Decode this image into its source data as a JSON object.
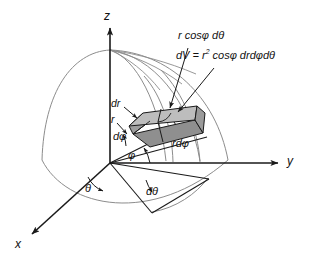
{
  "figure": {
    "background_color": "#ffffff",
    "line_color": "#1a1a1a",
    "sphere_arc_color": "#8c8c8c",
    "wedge_top_color": "#b5b5b5",
    "wedge_side_color": "#8f8f8f",
    "wedge_front_color": "#a6a6a6"
  },
  "axes": [
    {
      "name": "z-axis",
      "label": "z",
      "direction": "up"
    },
    {
      "name": "y-axis",
      "label": "y",
      "direction": "right"
    },
    {
      "name": "x-axis",
      "label": "x",
      "direction": "down-left"
    }
  ],
  "labels": {
    "z_axis": "z",
    "y_axis": "y",
    "x_axis": "x",
    "arc_length_theta": "r cosφ dθ",
    "volume_prefix": "dV = ",
    "volume_base": "r",
    "volume_exponent": "2",
    "volume_suffix": " cosφ drdφdθ",
    "dr": "dr",
    "r": "r",
    "d_phi": "dφ",
    "phi": "φ",
    "theta": "θ",
    "d_theta": "dθ",
    "r_d_phi": "rdφ"
  },
  "annotations": [
    {
      "name": "arc-length-theta-callout",
      "text": "r cosφ dθ",
      "points_to": "volume-element-top-edge"
    },
    {
      "name": "volume-formula-callout",
      "text": "dV = r² cosφ drdφdθ",
      "points_to": "volume-element"
    },
    {
      "name": "dr-callout",
      "text": "dr",
      "points_to": "volume-element-radial-edge"
    },
    {
      "name": "r-callout",
      "text": "r",
      "points_to": "radial-ray"
    },
    {
      "name": "d-phi-angle",
      "text": "dφ",
      "points_to": "phi-increment-arc"
    },
    {
      "name": "phi-angle",
      "text": "φ",
      "points_to": "phi-arc"
    },
    {
      "name": "theta-angle",
      "text": "θ",
      "points_to": "theta-arc"
    },
    {
      "name": "d-theta-angle",
      "text": "dθ",
      "points_to": "theta-increment-arc"
    },
    {
      "name": "r-d-phi-callout",
      "text": "rdφ",
      "points_to": "volume-element-side-edge"
    }
  ]
}
